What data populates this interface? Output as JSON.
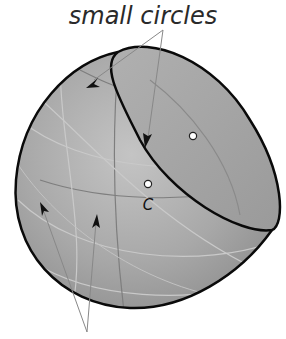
{
  "diagram": {
    "title": "small circles",
    "center_label": "C",
    "colors": {
      "sphere_fill": "#a9a9a9",
      "sphere_outline": "#0a0a0a",
      "grid_lines": "#c8c8c8",
      "dark_grid": "#7a7a7a",
      "pointer": "#888888",
      "arrowhead": "#111111",
      "pole_dot": "#ffffff"
    },
    "elements": [
      {
        "name": "sphere",
        "shape": "truncated sphere with elliptical cut face"
      },
      {
        "name": "cut-face-small-circle",
        "shape": "ellipse outline (small circle plane)"
      },
      {
        "name": "small-circle-pole",
        "shape": "white dot inside cut face"
      },
      {
        "name": "sphere-center",
        "shape": "white dot labeled C"
      },
      {
        "name": "pointer-arrows-top",
        "count": 2,
        "target": "small circles"
      },
      {
        "name": "pointer-arrows-bottom",
        "count": 2,
        "target": "great circles"
      }
    ]
  }
}
